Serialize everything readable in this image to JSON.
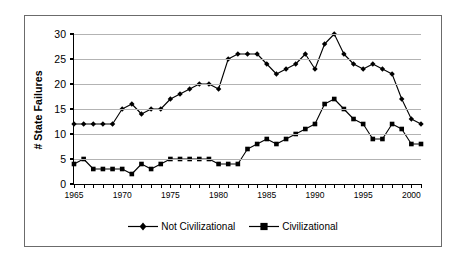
{
  "chart_data": {
    "type": "line",
    "title": "",
    "subtitle": "",
    "xlabel": "",
    "ylabel": "# State Failures",
    "x": [
      1965,
      1966,
      1967,
      1968,
      1969,
      1970,
      1971,
      1972,
      1973,
      1974,
      1975,
      1976,
      1977,
      1978,
      1979,
      1980,
      1981,
      1982,
      1983,
      1984,
      1985,
      1986,
      1987,
      1988,
      1989,
      1990,
      1991,
      1992,
      1993,
      1994,
      1995,
      1996,
      1997,
      1998,
      1999,
      2000,
      2001
    ],
    "xlim": [
      1965,
      2001
    ],
    "ylim": [
      0,
      30
    ],
    "ytick_values": [
      0,
      5,
      10,
      15,
      20,
      25,
      30
    ],
    "ytick_labels": [
      "0",
      "5",
      "10",
      "15",
      "20",
      "25",
      "30"
    ],
    "xtick_values": [
      1965,
      1970,
      1975,
      1980,
      1985,
      1990,
      1995,
      2000
    ],
    "xtick_labels": [
      "1965",
      "1970",
      "1975",
      "1980",
      "1985",
      "1990",
      "1995",
      "2000"
    ],
    "xtick_interval_minor": 1,
    "grid": "horizontal",
    "grid_color": "#b3b3b3",
    "legend_position": "bottom-center",
    "series": [
      {
        "name": "Not Civilizational",
        "marker": "diamond",
        "color": "#000000",
        "values": [
          12,
          12,
          12,
          12,
          12,
          15,
          16,
          14,
          15,
          15,
          17,
          18,
          19,
          20,
          20,
          19,
          25,
          26,
          26,
          26,
          24,
          22,
          23,
          24,
          26,
          23,
          28,
          30,
          26,
          24,
          23,
          24,
          23,
          22,
          17,
          13,
          12
        ]
      },
      {
        "name": "Civilizational",
        "marker": "square",
        "color": "#000000",
        "values": [
          4,
          5,
          3,
          3,
          3,
          3,
          2,
          4,
          3,
          4,
          5,
          5,
          5,
          5,
          5,
          4,
          4,
          4,
          7,
          8,
          9,
          8,
          9,
          10,
          11,
          12,
          16,
          17,
          15,
          13,
          12,
          9,
          9,
          12,
          11,
          8,
          8
        ]
      }
    ]
  },
  "legend": {
    "entries": [
      {
        "label": "Not Civilizational",
        "marker": "diamond-marker-icon"
      },
      {
        "label": "Civilizational",
        "marker": "square-marker-icon"
      }
    ]
  },
  "axis": {
    "y_title": "# State Failures"
  }
}
